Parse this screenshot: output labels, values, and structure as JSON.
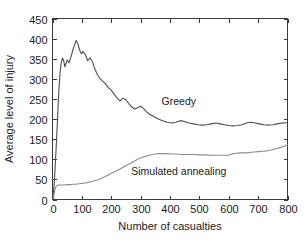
{
  "chart_data": {
    "type": "line",
    "title": "",
    "xlabel": "Number of casualties",
    "ylabel": "Average level of injury",
    "xlim": [
      0,
      800
    ],
    "ylim": [
      0,
      450
    ],
    "xticks": [
      0,
      100,
      200,
      300,
      400,
      500,
      600,
      700,
      800
    ],
    "yticks": [
      0,
      50,
      100,
      150,
      200,
      250,
      300,
      350,
      400,
      450
    ],
    "xtick_labels": [
      "0",
      "100",
      "200",
      "300",
      "400",
      "500",
      "600",
      "700",
      "800"
    ],
    "ytick_labels": [
      "0",
      "50",
      "100",
      "150",
      "200",
      "250",
      "300",
      "350",
      "400",
      "450"
    ],
    "grid": false,
    "legend_position": "inline-annotations",
    "series": [
      {
        "name": "Greedy",
        "color": "#4d4d4d",
        "label_x": 430,
        "label_y": 235,
        "x": [
          2,
          6,
          10,
          14,
          18,
          22,
          26,
          30,
          34,
          38,
          42,
          46,
          50,
          56,
          62,
          68,
          74,
          80,
          86,
          92,
          98,
          104,
          112,
          120,
          128,
          136,
          144,
          152,
          160,
          170,
          180,
          190,
          200,
          210,
          220,
          230,
          240,
          250,
          260,
          270,
          280,
          290,
          300,
          310,
          320,
          330,
          340,
          350,
          360,
          375,
          390,
          405,
          420,
          435,
          450,
          465,
          480,
          495,
          510,
          525,
          540,
          555,
          570,
          585,
          600,
          615,
          630,
          645,
          660,
          675,
          690,
          705,
          720,
          735,
          750,
          765,
          780,
          795,
          800
        ],
        "y": [
          8,
          40,
          95,
          150,
          215,
          275,
          318,
          340,
          352,
          345,
          330,
          338,
          347,
          340,
          352,
          368,
          382,
          395,
          388,
          372,
          362,
          368,
          360,
          345,
          352,
          342,
          325,
          312,
          302,
          295,
          288,
          278,
          272,
          262,
          252,
          245,
          252,
          248,
          238,
          230,
          225,
          228,
          232,
          226,
          218,
          212,
          208,
          204,
          200,
          196,
          192,
          190,
          192,
          196,
          194,
          190,
          188,
          186,
          185,
          186,
          188,
          190,
          188,
          186,
          184,
          183,
          184,
          186,
          190,
          192,
          190,
          188,
          186,
          185,
          186,
          188,
          190,
          191,
          191
        ]
      },
      {
        "name": "Simulated annealing",
        "color": "#8c8c8c",
        "label_x": 430,
        "label_y": 62,
        "x": [
          2,
          5,
          8,
          12,
          16,
          20,
          25,
          30,
          40,
          50,
          60,
          70,
          80,
          90,
          100,
          110,
          120,
          130,
          140,
          150,
          160,
          170,
          180,
          190,
          200,
          215,
          230,
          245,
          260,
          275,
          290,
          300,
          310,
          320,
          330,
          340,
          350,
          360,
          375,
          390,
          405,
          420,
          440,
          460,
          480,
          500,
          520,
          540,
          560,
          575,
          590,
          600,
          605,
          615,
          625,
          640,
          655,
          670,
          685,
          700,
          715,
          730,
          745,
          760,
          775,
          790,
          800
        ],
        "y": [
          2,
          12,
          24,
          32,
          35,
          36,
          36,
          36,
          36,
          37,
          37,
          38,
          38,
          39,
          40,
          41,
          42,
          44,
          46,
          48,
          51,
          54,
          57,
          61,
          65,
          70,
          76,
          82,
          88,
          94,
          100,
          103,
          106,
          108,
          110,
          112,
          113,
          114,
          114,
          114,
          113,
          113,
          112,
          112,
          112,
          111,
          111,
          110,
          110,
          110,
          110,
          110,
          112,
          114,
          115,
          116,
          116,
          117,
          118,
          119,
          120,
          121,
          123,
          126,
          129,
          133,
          136
        ]
      }
    ]
  },
  "figure": {
    "background_color": "#ffffff",
    "axis_color": "#3a3a3a"
  }
}
